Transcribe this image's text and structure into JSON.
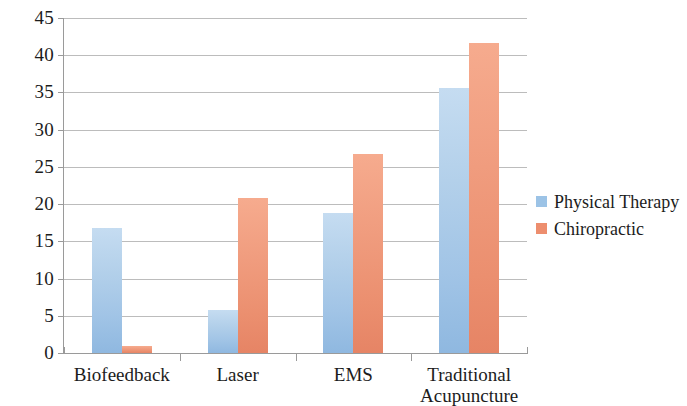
{
  "chart_data": {
    "type": "bar",
    "title": "",
    "subtitle": "",
    "xlabel": "",
    "ylabel": "",
    "categories": [
      "Biofeedback",
      "Laser",
      "EMS",
      "Traditional Acupuncture"
    ],
    "category_label_lines": [
      [
        "Biofeedback"
      ],
      [
        "Laser"
      ],
      [
        "EMS"
      ],
      [
        "Traditional",
        "Acupuncture"
      ]
    ],
    "series": [
      {
        "name": "Physical Therapy",
        "color": "#9cc3e6",
        "values": [
          16.8,
          5.8,
          18.8,
          35.6
        ]
      },
      {
        "name": "Chiropractic",
        "color": "#ed8e6e",
        "values": [
          0.9,
          20.8,
          26.7,
          41.7
        ]
      }
    ],
    "ylim": [
      0,
      45
    ],
    "ytick_step": 5,
    "ytick_labels": [
      "45",
      "40",
      "35",
      "30",
      "25",
      "20",
      "15",
      "10",
      "5",
      "0"
    ],
    "ytick_values": [
      45,
      40,
      35,
      30,
      25,
      20,
      15,
      10,
      5,
      0
    ],
    "grid": true,
    "grid_axis": "y",
    "legend_position": "right",
    "legend_entries": [
      "Physical Therapy",
      "Chiropractic"
    ],
    "background_color": "#ffffff",
    "gridline_color": "#b0b0b0",
    "axis_color": "#9a9a9a"
  }
}
